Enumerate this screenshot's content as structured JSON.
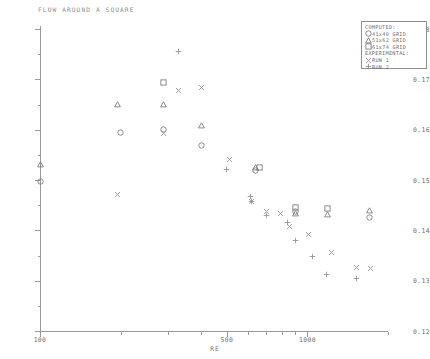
{
  "title": "FLOW AROUND A SQUARE",
  "axes": {
    "x": {
      "label": "RE",
      "scale": "log",
      "min": 100,
      "max": 2000,
      "ticks": [
        100,
        500,
        1000
      ],
      "tick_labels": [
        "100",
        "500",
        "1000"
      ]
    },
    "y": {
      "label": "",
      "scale": "linear",
      "min": 0.12,
      "max": 0.18,
      "ticks": [
        0.12,
        0.13,
        0.14,
        0.15,
        0.16,
        0.17,
        0.18
      ],
      "tick_labels": [
        "0.12",
        "0.13",
        "0.14",
        "0.15",
        "0.16",
        "0.17",
        "0.18"
      ]
    }
  },
  "legend": {
    "computed_header": "COMPUTED:",
    "experimental_header": "EXPERIMENTAL:",
    "items": [
      {
        "symbol": "circle",
        "label": "41x40 GRID"
      },
      {
        "symbol": "triangle",
        "label": "51x62 GRID"
      },
      {
        "symbol": "square",
        "label": "61x74 GRID"
      },
      {
        "symbol": "cross",
        "label": "RUN 1"
      },
      {
        "symbol": "plus",
        "label": "RUN 2"
      }
    ]
  },
  "chart_data": {
    "type": "scatter",
    "title": "FLOW AROUND A SQUARE",
    "xlabel": "RE",
    "ylabel": "",
    "xscale": "log",
    "xlim": [
      100,
      2000
    ],
    "ylim": [
      0.12,
      0.18
    ],
    "grid": false,
    "legend_position": "top-right",
    "series": [
      {
        "name": "41x40 GRID",
        "symbol": "circle",
        "group": "COMPUTED",
        "points": [
          {
            "x": 100,
            "y": 0.1497
          },
          {
            "x": 200,
            "y": 0.1594
          },
          {
            "x": 290,
            "y": 0.1601
          },
          {
            "x": 400,
            "y": 0.1568
          },
          {
            "x": 640,
            "y": 0.1519
          },
          {
            "x": 900,
            "y": 0.1437
          },
          {
            "x": 1700,
            "y": 0.1425
          }
        ]
      },
      {
        "name": "51x62 GRID",
        "symbol": "triangle",
        "group": "COMPUTED",
        "points": [
          {
            "x": 100,
            "y": 0.153
          },
          {
            "x": 195,
            "y": 0.165
          },
          {
            "x": 290,
            "y": 0.165
          },
          {
            "x": 400,
            "y": 0.1608
          },
          {
            "x": 640,
            "y": 0.1525
          },
          {
            "x": 905,
            "y": 0.1433
          },
          {
            "x": 1190,
            "y": 0.1432
          },
          {
            "x": 1700,
            "y": 0.144
          }
        ]
      },
      {
        "name": "61x74 GRID",
        "symbol": "square",
        "group": "COMPUTED",
        "points": [
          {
            "x": 290,
            "y": 0.1693
          },
          {
            "x": 900,
            "y": 0.1446
          },
          {
            "x": 1190,
            "y": 0.1444
          },
          {
            "x": 660,
            "y": 0.1524
          }
        ]
      },
      {
        "name": "RUN 1",
        "symbol": "cross",
        "group": "EXPERIMENTAL",
        "points": [
          {
            "x": 330,
            "y": 0.1678
          },
          {
            "x": 400,
            "y": 0.1683
          },
          {
            "x": 290,
            "y": 0.1592
          },
          {
            "x": 510,
            "y": 0.154
          },
          {
            "x": 195,
            "y": 0.1472
          },
          {
            "x": 620,
            "y": 0.1458
          },
          {
            "x": 700,
            "y": 0.1437
          },
          {
            "x": 790,
            "y": 0.1433
          },
          {
            "x": 860,
            "y": 0.1408
          },
          {
            "x": 1010,
            "y": 0.1392
          },
          {
            "x": 1230,
            "y": 0.1355
          },
          {
            "x": 1520,
            "y": 0.1327
          },
          {
            "x": 1720,
            "y": 0.1325
          }
        ]
      },
      {
        "name": "RUN 2",
        "symbol": "plus",
        "group": "EXPERIMENTAL",
        "points": [
          {
            "x": 330,
            "y": 0.1755
          },
          {
            "x": 500,
            "y": 0.152
          },
          {
            "x": 610,
            "y": 0.1468
          },
          {
            "x": 620,
            "y": 0.1458
          },
          {
            "x": 700,
            "y": 0.143
          },
          {
            "x": 840,
            "y": 0.1415
          },
          {
            "x": 900,
            "y": 0.138
          },
          {
            "x": 1040,
            "y": 0.1348
          },
          {
            "x": 1180,
            "y": 0.1313
          },
          {
            "x": 1530,
            "y": 0.1305
          }
        ]
      }
    ]
  }
}
